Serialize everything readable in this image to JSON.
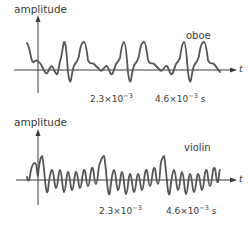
{
  "figure": {
    "panels": [
      {
        "id": "oboe",
        "y_axis_label": "amplitude",
        "x_axis_label": "t",
        "instrument_label": "oboe",
        "tick_1": {
          "mantissa": "2.3×10",
          "exponent": "−3",
          "unit": ""
        },
        "tick_2": {
          "mantissa": "4.6×10",
          "exponent": "−3",
          "unit": " s"
        },
        "waveform_path": "M27,43 C29,46 30,52 31,57 C32,62 33,63 35,61 C37,59 38,62 40,63 C42,66 43,69 45,72 C47,76 48,71 50,68 C52,64 53,67 54,70 C56,74 57,76 58,72 C59,66 60,60 61,58 C62,55 63,44 64,42 C66,40 67,60 68,72 C69,80 70,84 71,80 C72,74 73,66 75,64 C77,62 78,60 79,56 C80,48 82,42 84,42 C86,42 87,54 88,60 C90,66 92,62 94,64 C96,66 98,68 100,70 C102,73 104,67 106,66 C108,65 109,72 111,74 C113,76 114,68 116,64 C118,62 119,60 120,58 C121,50 122,43 124,42 C126,42 127,62 128,72 C129,80 130,84 131,80 C132,74 133,66 135,64 C137,62 138,60 139,56 C140,48 142,42 144,42 C146,42 147,54 148,60 C150,66 152,62 154,64 C156,66 158,68 160,70 C162,73 164,67 166,66 C168,65 169,72 171,74 C173,76 174,68 176,64 C178,62 179,60 180,58 C181,50 182,43 184,42 C186,42 187,62 188,72 C189,80 190,84 191,80 C192,74 193,66 195,64 C197,62 198,60 199,56 C200,48 202,42 204,42 C206,42 207,54 208,60 C210,66 212,62 214,64 C216,66 218,70 220,72",
        "colors": {
          "axis": "#3a3a3a",
          "waveform": "#555555"
        }
      },
      {
        "id": "violin",
        "y_axis_label": "amplitude",
        "x_axis_label": "t",
        "instrument_label": "violin",
        "tick_1": {
          "mantissa": "2.3×10",
          "exponent": "−3",
          "unit": ""
        },
        "tick_2": {
          "mantissa": "4.6×10",
          "exponent": "−3",
          "unit": " s"
        },
        "waveform_path": "M27,177 C28,182 29,182 30,176 C31,168 33,163 35,163 C37,163 37,176 38,176 C39,164 41,157 42,156 C43,157 44,170 45,180 C46,190 47,196 48,190 C49,180 50,172 52,170 C54,170 54,186 56,188 C58,188 58,172 60,170 C62,170 62,190 64,192 C66,192 66,174 68,172 C70,172 70,188 72,190 C74,190 74,174 76,172 C78,172 78,186 80,188 C82,188 82,172 84,170 C86,168 86,186 88,186 C90,186 90,170 92,168 C94,166 94,184 96,184 C98,184 98,166 100,163 C101,160 103,156 104,156 C105,158 106,172 107,182 C108,192 109,198 110,192 C111,182 112,172 114,170 C116,170 116,188 118,190 C120,190 120,174 122,172 C124,172 124,192 126,194 C128,194 128,176 130,174 C132,174 132,190 134,192 C136,192 136,176 138,174 C140,174 140,188 142,190 C144,190 144,172 146,170 C148,168 148,186 150,186 C152,186 152,170 154,168 C156,166 156,184 158,184 C160,184 160,166 161,162 C162,159 163,156 164,156 C165,158 166,172 167,182 C168,192 169,198 170,192 C171,182 172,172 174,170 C176,170 176,188 178,190 C180,190 180,174 182,172 C184,172 184,192 186,194 C188,194 188,176 190,174 C192,174 192,190 194,192 C196,192 196,176 198,174 C200,174 200,188 202,190 C204,190 204,172 206,170 C208,168 208,186 210,186 C212,186 212,170 214,168 C216,166 216,184 218,182 C219,180 219,170 220,170",
        "colors": {
          "axis": "#3a3a3a",
          "waveform": "#555555"
        }
      }
    ]
  }
}
